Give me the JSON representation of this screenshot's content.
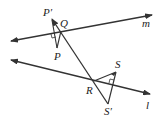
{
  "diagram": {
    "type": "geometry-reflection",
    "stroke_color": "#333333",
    "labels": {
      "p_prime": "P′",
      "q": "Q",
      "p": "P",
      "m": "m",
      "r": "R",
      "s": "S",
      "s_prime": "S′",
      "l": "l"
    },
    "lines": {
      "m": {
        "from": [
          11,
          41
        ],
        "to": [
          152,
          15
        ],
        "arrows": "both"
      },
      "l": {
        "from": [
          11,
          60
        ],
        "to": [
          150,
          94
        ],
        "arrows": "both"
      },
      "transversal": {
        "from": [
          52,
          19
        ],
        "to": [
          108,
          104
        ],
        "arrows": "start"
      }
    },
    "segments": [
      {
        "name": "P-P'",
        "from": [
          57,
          48
        ],
        "to": [
          52,
          19
        ]
      },
      {
        "name": "P-Q",
        "from": [
          57,
          48
        ],
        "to": [
          61,
          31
        ]
      },
      {
        "name": "R-S",
        "from": [
          94,
          81
        ],
        "to": [
          116,
          72
        ]
      },
      {
        "name": "S-S'",
        "from": [
          116,
          72
        ],
        "to": [
          108,
          104
        ]
      }
    ]
  }
}
